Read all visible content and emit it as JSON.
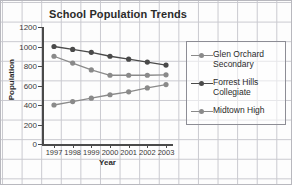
{
  "chart_data": {
    "type": "line",
    "title": "School Population Trends",
    "xlabel": "Year",
    "ylabel": "Population",
    "categories": [
      "1997",
      "1998",
      "1999",
      "2000",
      "2001",
      "2002",
      "2003"
    ],
    "x": [
      1997,
      1998,
      1999,
      2000,
      2001,
      2002,
      2003
    ],
    "ylim": [
      0,
      1200
    ],
    "yticks": [
      0,
      200,
      400,
      600,
      800,
      1000,
      1200
    ],
    "ytick_labels": [
      "0",
      "200",
      "400",
      "600",
      "800",
      "1000",
      "1200"
    ],
    "grid": true,
    "grid_style": "graph-paper-background",
    "legend_position": "right",
    "markers": "circle",
    "series": [
      {
        "name": "Glen Orchard Secondary",
        "legend_label": "Glen Orchard\nSecondary",
        "color": "#8a8a8a",
        "values": [
          900,
          830,
          760,
          705,
          705,
          705,
          710
        ]
      },
      {
        "name": "Forrest Hills Collegiate",
        "legend_label": "Forrest Hills\nCollegiate",
        "color": "#4a4a4a",
        "values": [
          1000,
          970,
          940,
          900,
          870,
          840,
          810
        ]
      },
      {
        "name": "Midtown High",
        "legend_label": "Midtown High",
        "color": "#8a8a8a",
        "values": [
          400,
          435,
          470,
          505,
          535,
          575,
          610
        ]
      }
    ]
  },
  "axis": {
    "axis_color": "#4a4a4a",
    "tick_color": "#4a4a4a"
  }
}
